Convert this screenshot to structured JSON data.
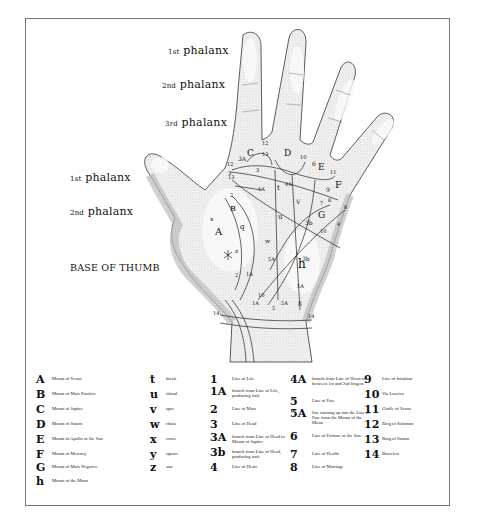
{
  "figure": {
    "labels": {
      "finger_phalanx_1": {
        "num": "1st",
        "text": "phalanx"
      },
      "finger_phalanx_2": {
        "num": "2nd",
        "text": "phalanx"
      },
      "finger_phalanx_3": {
        "num": "3rd",
        "text": "phalanx"
      },
      "thumb_phalanx_1": {
        "num": "1st",
        "text": "phalanx"
      },
      "thumb_phalanx_2": {
        "num": "2nd",
        "text": "phalanx"
      },
      "thumb_base": "BASE OF THUMB"
    },
    "markers": [
      {
        "t": "3A",
        "x": 238,
        "y": 162,
        "s": 6
      },
      {
        "t": "C",
        "x": 247,
        "y": 158,
        "s": 9
      },
      {
        "t": "12",
        "x": 262,
        "y": 146,
        "s": 5
      },
      {
        "t": "13",
        "x": 262,
        "y": 157,
        "s": 5
      },
      {
        "t": "D",
        "x": 284,
        "y": 158,
        "s": 9
      },
      {
        "t": "10",
        "x": 300,
        "y": 160,
        "s": 5
      },
      {
        "t": "6",
        "x": 312,
        "y": 167,
        "s": 6
      },
      {
        "t": "E",
        "x": 318,
        "y": 172,
        "s": 9
      },
      {
        "t": "11",
        "x": 330,
        "y": 175,
        "s": 5
      },
      {
        "t": "12",
        "x": 227,
        "y": 167,
        "s": 5
      },
      {
        "t": "3",
        "x": 228,
        "y": 176,
        "s": 5
      },
      {
        "t": "13",
        "x": 228,
        "y": 180,
        "s": 5
      },
      {
        "t": "3",
        "x": 256,
        "y": 173,
        "s": 5
      },
      {
        "t": "1A",
        "x": 258,
        "y": 192,
        "s": 5
      },
      {
        "t": "t",
        "x": 277,
        "y": 192,
        "s": 7
      },
      {
        "t": "4A",
        "x": 285,
        "y": 187,
        "s": 5
      },
      {
        "t": "V",
        "x": 296,
        "y": 205,
        "s": 6
      },
      {
        "t": "9",
        "x": 326,
        "y": 193,
        "s": 6
      },
      {
        "t": "F",
        "x": 335,
        "y": 190,
        "s": 10
      },
      {
        "t": "7",
        "x": 320,
        "y": 206,
        "s": 5
      },
      {
        "t": "8",
        "x": 328,
        "y": 203,
        "s": 5
      },
      {
        "t": "8",
        "x": 344,
        "y": 210,
        "s": 5
      },
      {
        "t": "2",
        "x": 230,
        "y": 198,
        "s": 5
      },
      {
        "t": "B",
        "x": 230,
        "y": 213,
        "s": 8
      },
      {
        "t": "x",
        "x": 210,
        "y": 222,
        "s": 6
      },
      {
        "t": "u",
        "x": 278,
        "y": 221,
        "s": 7
      },
      {
        "t": "3b",
        "x": 305,
        "y": 226,
        "s": 6
      },
      {
        "t": "G",
        "x": 318,
        "y": 220,
        "s": 9
      },
      {
        "t": "4",
        "x": 337,
        "y": 227,
        "s": 5
      },
      {
        "t": "10",
        "x": 320,
        "y": 234,
        "s": 5
      },
      {
        "t": "A",
        "x": 215,
        "y": 237,
        "s": 10
      },
      {
        "t": "q",
        "x": 240,
        "y": 231,
        "s": 7
      },
      {
        "t": "w",
        "x": 265,
        "y": 244,
        "s": 6
      },
      {
        "t": "z",
        "x": 235,
        "y": 254,
        "s": 6
      },
      {
        "t": "5A",
        "x": 268,
        "y": 262,
        "s": 5
      },
      {
        "t": "3b",
        "x": 302,
        "y": 262,
        "s": 6
      },
      {
        "t": "h",
        "x": 298,
        "y": 270,
        "s": 12
      },
      {
        "t": "2",
        "x": 235,
        "y": 278,
        "s": 5
      },
      {
        "t": "1A",
        "x": 246,
        "y": 277,
        "s": 5
      },
      {
        "t": "5A",
        "x": 297,
        "y": 289,
        "s": 5
      },
      {
        "t": "10",
        "x": 258,
        "y": 298,
        "s": 5
      },
      {
        "t": "1A",
        "x": 252,
        "y": 306,
        "s": 5
      },
      {
        "t": "5",
        "x": 272,
        "y": 311,
        "s": 5
      },
      {
        "t": "5A",
        "x": 281,
        "y": 306,
        "s": 5
      },
      {
        "t": "8",
        "x": 298,
        "y": 307,
        "s": 6
      },
      {
        "t": "14",
        "x": 213,
        "y": 316,
        "s": 5
      },
      {
        "t": "14",
        "x": 308,
        "y": 319,
        "s": 5
      }
    ]
  },
  "legend": {
    "mounts": [
      {
        "sym": "A",
        "label": "Mount of Venus"
      },
      {
        "sym": "B",
        "label": "Mount of Mars Positive"
      },
      {
        "sym": "C",
        "label": "Mount of Jupiter"
      },
      {
        "sym": "D",
        "label": "Mount of Saturn"
      },
      {
        "sym": "E",
        "label": "Mount of Apollo or the Sun"
      },
      {
        "sym": "F",
        "label": "Mount of Mercury"
      },
      {
        "sym": "G",
        "label": "Mount of Mars Negative"
      },
      {
        "sym": "h",
        "label": "Mount of the Moon"
      }
    ],
    "marks": [
      {
        "sym": "t",
        "label": "break"
      },
      {
        "sym": "u",
        "label": "island"
      },
      {
        "sym": "v",
        "label": "spot"
      },
      {
        "sym": "w",
        "label": "chain"
      },
      {
        "sym": "x",
        "label": "cross"
      },
      {
        "sym": "y",
        "label": "square"
      },
      {
        "sym": "z",
        "label": "star"
      }
    ],
    "lines_a": [
      {
        "sym": "1",
        "label": "Line of Life"
      },
      {
        "sym": "1A",
        "label": "branch from Line of Life, producing fork"
      },
      {
        "sym": "2",
        "label": "Line of Mars"
      },
      {
        "sym": "3",
        "label": "Line of Head"
      },
      {
        "sym": "3A",
        "label": "branch from Line of Head to Mount of Jupiter"
      },
      {
        "sym": "3b",
        "label": "branch from Line of Head, producing fork"
      },
      {
        "sym": "4",
        "label": "Line of Heart"
      }
    ],
    "lines_b": [
      {
        "sym": "4A",
        "label": "branch from Line of Heart to between 1st and 2nd fingers"
      },
      {
        "sym": "5",
        "label": "Line of Fate"
      },
      {
        "sym": "5A",
        "label": "line running up into the Line of Fate from the Mount of the Moon"
      },
      {
        "sym": "6",
        "label": "Line of Fortune or the Sun"
      },
      {
        "sym": "7",
        "label": "Line of Health"
      },
      {
        "sym": "8",
        "label": "Line of Marriage"
      }
    ],
    "lines_c": [
      {
        "sym": "9",
        "label": "Line of Intuition"
      },
      {
        "sym": "10",
        "label": "Via Lasciva"
      },
      {
        "sym": "11",
        "label": "Girdle of Venus"
      },
      {
        "sym": "12",
        "label": "Ring of Solomon"
      },
      {
        "sym": "13",
        "label": "Ring of Saturn"
      },
      {
        "sym": "14",
        "label": "Bracelets"
      }
    ]
  }
}
